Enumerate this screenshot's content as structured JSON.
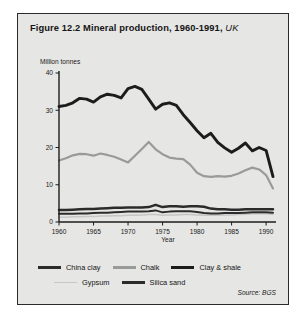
{
  "figure": {
    "title_main": "Figure 12.2 Mineral production, 1960-1991,",
    "title_region": "UK",
    "source": "Source: BGS"
  },
  "axes": {
    "ylabel": "Million tonnes",
    "xlabel": "Year",
    "yticks": [
      "0",
      "10",
      "20",
      "30",
      "40"
    ],
    "xticks": [
      "1960",
      "1965",
      "1970",
      "1975",
      "1980",
      "1985",
      "1990"
    ]
  },
  "legend": {
    "row1": [
      {
        "label": "China clay",
        "color": "#2b2b2b",
        "width": 2.6
      },
      {
        "label": "Chalk",
        "color": "#9a9a9a",
        "width": 2.2
      },
      {
        "label": "Clay & shale",
        "color": "#1c1c1c",
        "width": 3.0
      }
    ],
    "row2": [
      {
        "label": "Gypsum",
        "color": "#c6c6c6",
        "width": 1.6
      },
      {
        "label": "Silica sand",
        "color": "#2b2b2b",
        "width": 2.4
      }
    ]
  },
  "chart_data": {
    "type": "line",
    "title": "Figure 12.2 Mineral production, 1960-1991, UK",
    "xlabel": "Year",
    "ylabel": "Million tonnes",
    "xlim": [
      1960,
      1991
    ],
    "ylim": [
      0,
      40
    ],
    "grid": false,
    "legend_position": "bottom",
    "x": [
      1960,
      1961,
      1962,
      1963,
      1964,
      1965,
      1966,
      1967,
      1968,
      1969,
      1970,
      1971,
      1972,
      1973,
      1974,
      1975,
      1976,
      1977,
      1978,
      1979,
      1980,
      1981,
      1982,
      1983,
      1984,
      1985,
      1986,
      1987,
      1988,
      1989,
      1990,
      1991
    ],
    "series": [
      {
        "name": "Clay & shale",
        "color": "#1c1c1c",
        "width": 2.9,
        "values": [
          31.0,
          31.3,
          32.0,
          33.2,
          33.0,
          32.2,
          33.6,
          34.3,
          34.0,
          33.3,
          35.8,
          36.4,
          35.6,
          33.0,
          30.3,
          31.6,
          32.0,
          31.3,
          28.8,
          26.7,
          24.5,
          22.6,
          23.8,
          21.4,
          19.9,
          18.7,
          19.8,
          21.2,
          19.1,
          20.0,
          19.2,
          12.2
        ]
      },
      {
        "name": "Chalk",
        "color": "#9a9a9a",
        "width": 2.2,
        "values": [
          16.5,
          17.1,
          17.9,
          18.3,
          18.2,
          17.8,
          18.4,
          18.0,
          17.5,
          16.8,
          16.0,
          17.8,
          19.6,
          21.5,
          19.5,
          18.2,
          17.3,
          17.0,
          16.9,
          15.4,
          13.2,
          12.3,
          12.1,
          12.3,
          12.2,
          12.4,
          13.0,
          13.9,
          14.6,
          14.1,
          12.6,
          9.0
        ]
      },
      {
        "name": "China clay",
        "color": "#2b2b2b",
        "width": 2.5,
        "values": [
          3.2,
          3.2,
          3.3,
          3.4,
          3.5,
          3.5,
          3.6,
          3.7,
          3.8,
          3.8,
          3.9,
          3.9,
          3.9,
          4.0,
          4.6,
          4.0,
          4.2,
          4.2,
          4.1,
          4.2,
          4.2,
          4.1,
          3.6,
          3.4,
          3.4,
          3.3,
          3.3,
          3.4,
          3.4,
          3.4,
          3.4,
          3.4
        ]
      },
      {
        "name": "Silica sand",
        "color": "#2b2b2b",
        "width": 1.9,
        "values": [
          2.2,
          2.2,
          2.2,
          2.3,
          2.3,
          2.4,
          2.5,
          2.5,
          2.6,
          2.7,
          2.8,
          2.8,
          2.8,
          2.9,
          3.1,
          2.6,
          2.8,
          2.9,
          2.9,
          2.9,
          2.7,
          2.4,
          2.3,
          2.3,
          2.4,
          2.4,
          2.4,
          2.5,
          2.6,
          2.6,
          2.6,
          2.5
        ]
      },
      {
        "name": "Gypsum",
        "color": "#c6c6c6",
        "width": 1.5,
        "values": [
          1.3,
          1.3,
          1.4,
          1.4,
          1.5,
          1.5,
          1.6,
          1.6,
          1.7,
          1.7,
          1.8,
          1.8,
          1.9,
          2.0,
          2.0,
          1.8,
          1.9,
          1.9,
          2.0,
          2.0,
          1.9,
          1.8,
          1.8,
          1.8,
          1.9,
          1.9,
          2.0,
          2.1,
          2.2,
          2.2,
          2.2,
          2.1
        ]
      }
    ]
  }
}
